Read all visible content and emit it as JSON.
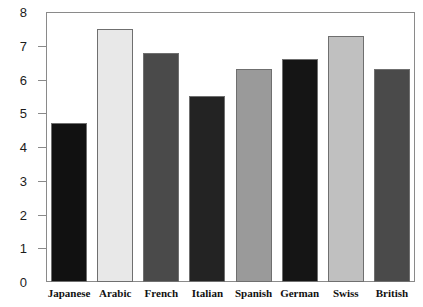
{
  "chart_data": {
    "type": "bar",
    "title": "",
    "xlabel": "",
    "ylabel": "",
    "ylim": [
      0,
      8
    ],
    "ytick_labels": [
      "8",
      "7",
      "6",
      "5",
      "4",
      "3",
      "2",
      "1",
      "0"
    ],
    "yticks": [
      8,
      7,
      6,
      5,
      4,
      3,
      2,
      1,
      0
    ],
    "grid": false,
    "legend": false,
    "categories": [
      "Japanese",
      "Arabic",
      "French",
      "Italian",
      "Spanish",
      "German",
      "Swiss",
      "British"
    ],
    "values": [
      4.7,
      7.5,
      6.8,
      5.5,
      6.3,
      6.6,
      7.3,
      6.3
    ],
    "bar_colors": [
      "#111111",
      "#e8e8e8",
      "#4a4a4a",
      "#232323",
      "#9a9a9a",
      "#151515",
      "#c0c0c0",
      "#4a4a4a"
    ],
    "bar_edge_color": "#6f6f6f",
    "axis_color": "#8a8a8a",
    "background_color": "#ffffff"
  }
}
